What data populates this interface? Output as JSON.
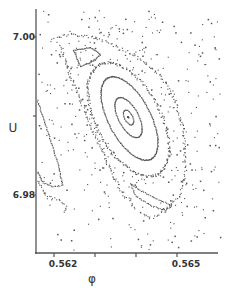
{
  "chart_data": {
    "type": "scatter",
    "title": "",
    "xlabel": "φ",
    "ylabel": "U",
    "xlim": [
      0.5616,
      0.566
    ],
    "ylim": [
      6.9735,
      7.0035
    ],
    "x_ticks": [
      {
        "value": 0.562,
        "label": "0.562"
      },
      {
        "value": 0.563,
        "label": ""
      },
      {
        "value": 0.564,
        "label": ""
      },
      {
        "value": 0.565,
        "label": "0.565"
      }
    ],
    "y_ticks": [
      {
        "value": 7.0,
        "label": "7.00"
      },
      {
        "value": 6.99,
        "label": ""
      },
      {
        "value": 6.98,
        "label": "6.98"
      }
    ],
    "grid": false,
    "legend": null,
    "frame": "left-and-bottom",
    "point_color": "#555555",
    "fixed_point": {
      "x": 0.56424,
      "y": 6.9899
    },
    "invariant_curves": [
      {
        "name": "core",
        "center": [
          0.56424,
          6.9899
        ],
        "semi_major": 0.0006,
        "semi_minor": 0.0001,
        "tilt_deg": 62
      },
      {
        "name": "inner-ring",
        "center": [
          0.56424,
          6.9899
        ],
        "semi_major": 0.0042,
        "semi_minor": 0.00028,
        "tilt_deg": 62
      },
      {
        "name": "middle-ring",
        "center": [
          0.56426,
          6.9898
        ],
        "semi_major": 0.01,
        "semi_minor": 0.0007,
        "tilt_deg": 62
      },
      {
        "name": "outer-ring",
        "center": [
          0.56425,
          6.9896
        ],
        "semi_major": 0.015,
        "semi_minor": 0.00112,
        "tilt_deg": 62
      }
    ],
    "islands": [
      {
        "name": "upper-triangle-island",
        "approx_center": [
          0.563,
          6.9965
        ]
      },
      {
        "name": "lower-right-island",
        "approx_center": [
          0.565,
          6.982
        ]
      },
      {
        "name": "left-edge-island",
        "approx_center": [
          0.5617,
          6.983
        ]
      }
    ]
  }
}
